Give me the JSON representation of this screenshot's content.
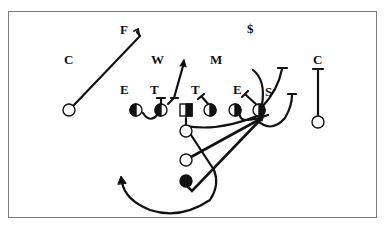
{
  "diagram": {
    "title": "",
    "type": "football-play-diagram",
    "colors": {
      "ink": "#111111",
      "frame": "#7a7a7a",
      "background": "#ffffff"
    },
    "defense": {
      "labels": [
        {
          "id": "F",
          "text": "F",
          "x": 124,
          "y": 34
        },
        {
          "id": "dollar",
          "text": "$",
          "x": 251,
          "y": 33
        },
        {
          "id": "C-left",
          "text": "C",
          "x": 68,
          "y": 64
        },
        {
          "id": "W",
          "text": "W",
          "x": 157,
          "y": 64
        },
        {
          "id": "M",
          "text": "M",
          "x": 216,
          "y": 64
        },
        {
          "id": "C-right",
          "text": "C",
          "x": 318,
          "y": 64
        },
        {
          "id": "E-left",
          "text": "E",
          "x": 125,
          "y": 94
        },
        {
          "id": "T-left",
          "text": "T",
          "x": 155,
          "y": 94
        },
        {
          "id": "T-right",
          "text": "T",
          "x": 196,
          "y": 94
        },
        {
          "id": "E-right",
          "text": "E",
          "x": 238,
          "y": 94
        },
        {
          "id": "S",
          "text": "S",
          "x": 270,
          "y": 96
        }
      ]
    },
    "offense": {
      "receivers": [
        {
          "id": "wr-left",
          "symbol": "open-circle",
          "x": 69,
          "y": 110
        },
        {
          "id": "wr-right",
          "symbol": "open-circle",
          "x": 318,
          "y": 122
        }
      ],
      "line": [
        {
          "id": "lt",
          "symbol": "half-filled-circle",
          "x": 136,
          "y": 110
        },
        {
          "id": "lg",
          "symbol": "half-filled-circle",
          "x": 161,
          "y": 110
        },
        {
          "id": "center",
          "symbol": "half-filled-square",
          "x": 186,
          "y": 110
        },
        {
          "id": "rg",
          "symbol": "half-filled-circle",
          "x": 210,
          "y": 110
        },
        {
          "id": "rt",
          "symbol": "half-filled-circle",
          "x": 235,
          "y": 110
        },
        {
          "id": "te",
          "symbol": "half-filled-circle",
          "x": 259,
          "y": 110
        }
      ],
      "backfield": [
        {
          "id": "qb",
          "symbol": "open-circle",
          "x": 186,
          "y": 131
        },
        {
          "id": "fb",
          "symbol": "open-circle",
          "x": 186,
          "y": 160
        },
        {
          "id": "tb",
          "symbol": "filled-circle",
          "x": 186,
          "y": 181
        }
      ]
    }
  }
}
